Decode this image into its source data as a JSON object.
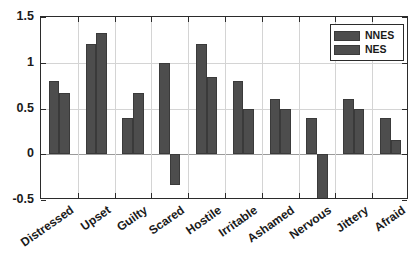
{
  "chart_data": {
    "type": "bar",
    "title": "",
    "xlabel": "",
    "ylabel": "",
    "categories": [
      "Distressed",
      "Upset",
      "Guilty",
      "Scared",
      "Hostile",
      "Irritable",
      "Ashamed",
      "Nervous",
      "Jittery",
      "Afraid"
    ],
    "series": [
      {
        "name": "NNES",
        "values": [
          0.8,
          1.2,
          0.4,
          1.0,
          1.2,
          0.8,
          0.6,
          0.4,
          0.6,
          0.4
        ]
      },
      {
        "name": "NES",
        "values": [
          0.67,
          1.33,
          0.67,
          -0.34,
          0.84,
          0.49,
          0.49,
          -0.51,
          0.49,
          0.16
        ]
      }
    ],
    "ylim": [
      -0.5,
      1.5
    ],
    "yticks": [
      "1.5",
      "1",
      "0.5",
      "0",
      "-0.5"
    ],
    "ytick_values": [
      1.5,
      1,
      0.5,
      0,
      -0.5
    ],
    "grid": true,
    "legend_position": "top-right",
    "bar_color": "#4d4d4d",
    "axis_color": "#2b2b2b",
    "grid_color": "#d4d4d4"
  },
  "legend": {
    "entries": [
      {
        "label": "NNES"
      },
      {
        "label": "NES"
      }
    ]
  }
}
